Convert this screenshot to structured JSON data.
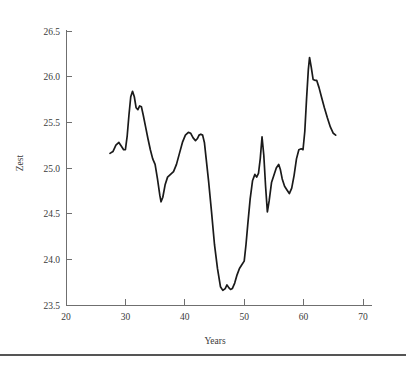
{
  "chart_data": {
    "type": "line",
    "title": "",
    "xlabel": "Years",
    "ylabel": "Zest",
    "xlim": [
      20,
      73
    ],
    "ylim": [
      23.5,
      26.6
    ],
    "grid": false,
    "legend": null,
    "x_ticks": [
      20,
      30,
      40,
      50,
      60,
      70
    ],
    "x_tick_labels": [
      "20",
      "30",
      "40",
      "50",
      "60",
      "70"
    ],
    "y_ticks": [
      23.5,
      24.0,
      24.5,
      25.0,
      25.5,
      26.0,
      26.5
    ],
    "y_tick_labels": [
      "23.5",
      "24.0",
      "24.5",
      "25.0",
      "25.5",
      "26.0",
      "26.5"
    ],
    "line_color": "#1a1a1a",
    "axis_color": "#6f6f6f",
    "series": [
      {
        "name": "Zest",
        "x": [
          27.4,
          27.9,
          28.4,
          28.9,
          29.3,
          29.7,
          30.0,
          30.3,
          30.6,
          30.9,
          31.2,
          31.5,
          31.8,
          32.1,
          32.4,
          32.7,
          33.0,
          33.4,
          33.8,
          34.2,
          34.6,
          35.0,
          35.4,
          35.8,
          36.0,
          36.3,
          36.7,
          37.1,
          37.6,
          38.1,
          38.6,
          39.1,
          39.6,
          40.1,
          40.6,
          41.0,
          41.4,
          41.8,
          42.1,
          42.4,
          42.7,
          43.0,
          43.3,
          43.6,
          44.0,
          44.5,
          45.0,
          45.5,
          46.0,
          46.4,
          46.8,
          47.1,
          47.4,
          47.7,
          48.0,
          48.4,
          48.8,
          49.2,
          49.6,
          50.0,
          50.3,
          50.6,
          51.0,
          51.4,
          51.8,
          52.1,
          52.4,
          52.7,
          53.0,
          53.3,
          53.6,
          53.9,
          54.2,
          54.6,
          55.0,
          55.4,
          55.8,
          56.1,
          56.4,
          56.8,
          57.2,
          57.6,
          58.0,
          58.4,
          58.8,
          59.2,
          59.6,
          59.9,
          60.2,
          60.5,
          60.8,
          61.0,
          61.3,
          61.6,
          61.9,
          62.2,
          62.6,
          63.0,
          63.5,
          64.0,
          64.5,
          65.0,
          65.4
        ],
        "y": [
          25.16,
          25.18,
          25.25,
          25.28,
          25.24,
          25.2,
          25.2,
          25.35,
          25.58,
          25.78,
          25.84,
          25.78,
          25.66,
          25.64,
          25.68,
          25.67,
          25.58,
          25.45,
          25.32,
          25.2,
          25.1,
          25.04,
          24.88,
          24.7,
          24.63,
          24.68,
          24.82,
          24.9,
          24.93,
          24.96,
          25.04,
          25.16,
          25.28,
          25.36,
          25.39,
          25.38,
          25.33,
          25.3,
          25.32,
          25.36,
          25.37,
          25.36,
          25.28,
          25.1,
          24.86,
          24.52,
          24.16,
          23.9,
          23.7,
          23.66,
          23.68,
          23.72,
          23.69,
          23.67,
          23.68,
          23.74,
          23.83,
          23.9,
          23.94,
          23.98,
          24.16,
          24.38,
          24.66,
          24.86,
          24.93,
          24.9,
          24.94,
          25.1,
          25.34,
          25.14,
          24.8,
          24.52,
          24.64,
          24.84,
          24.92,
          25.0,
          25.04,
          24.98,
          24.88,
          24.8,
          24.76,
          24.72,
          24.78,
          24.92,
          25.1,
          25.2,
          25.21,
          25.2,
          25.4,
          25.76,
          26.08,
          26.21,
          26.1,
          25.97,
          25.96,
          25.96,
          25.88,
          25.78,
          25.66,
          25.55,
          25.45,
          25.38,
          25.36
        ]
      }
    ]
  },
  "figure": {
    "footer_rule_visible": true
  }
}
